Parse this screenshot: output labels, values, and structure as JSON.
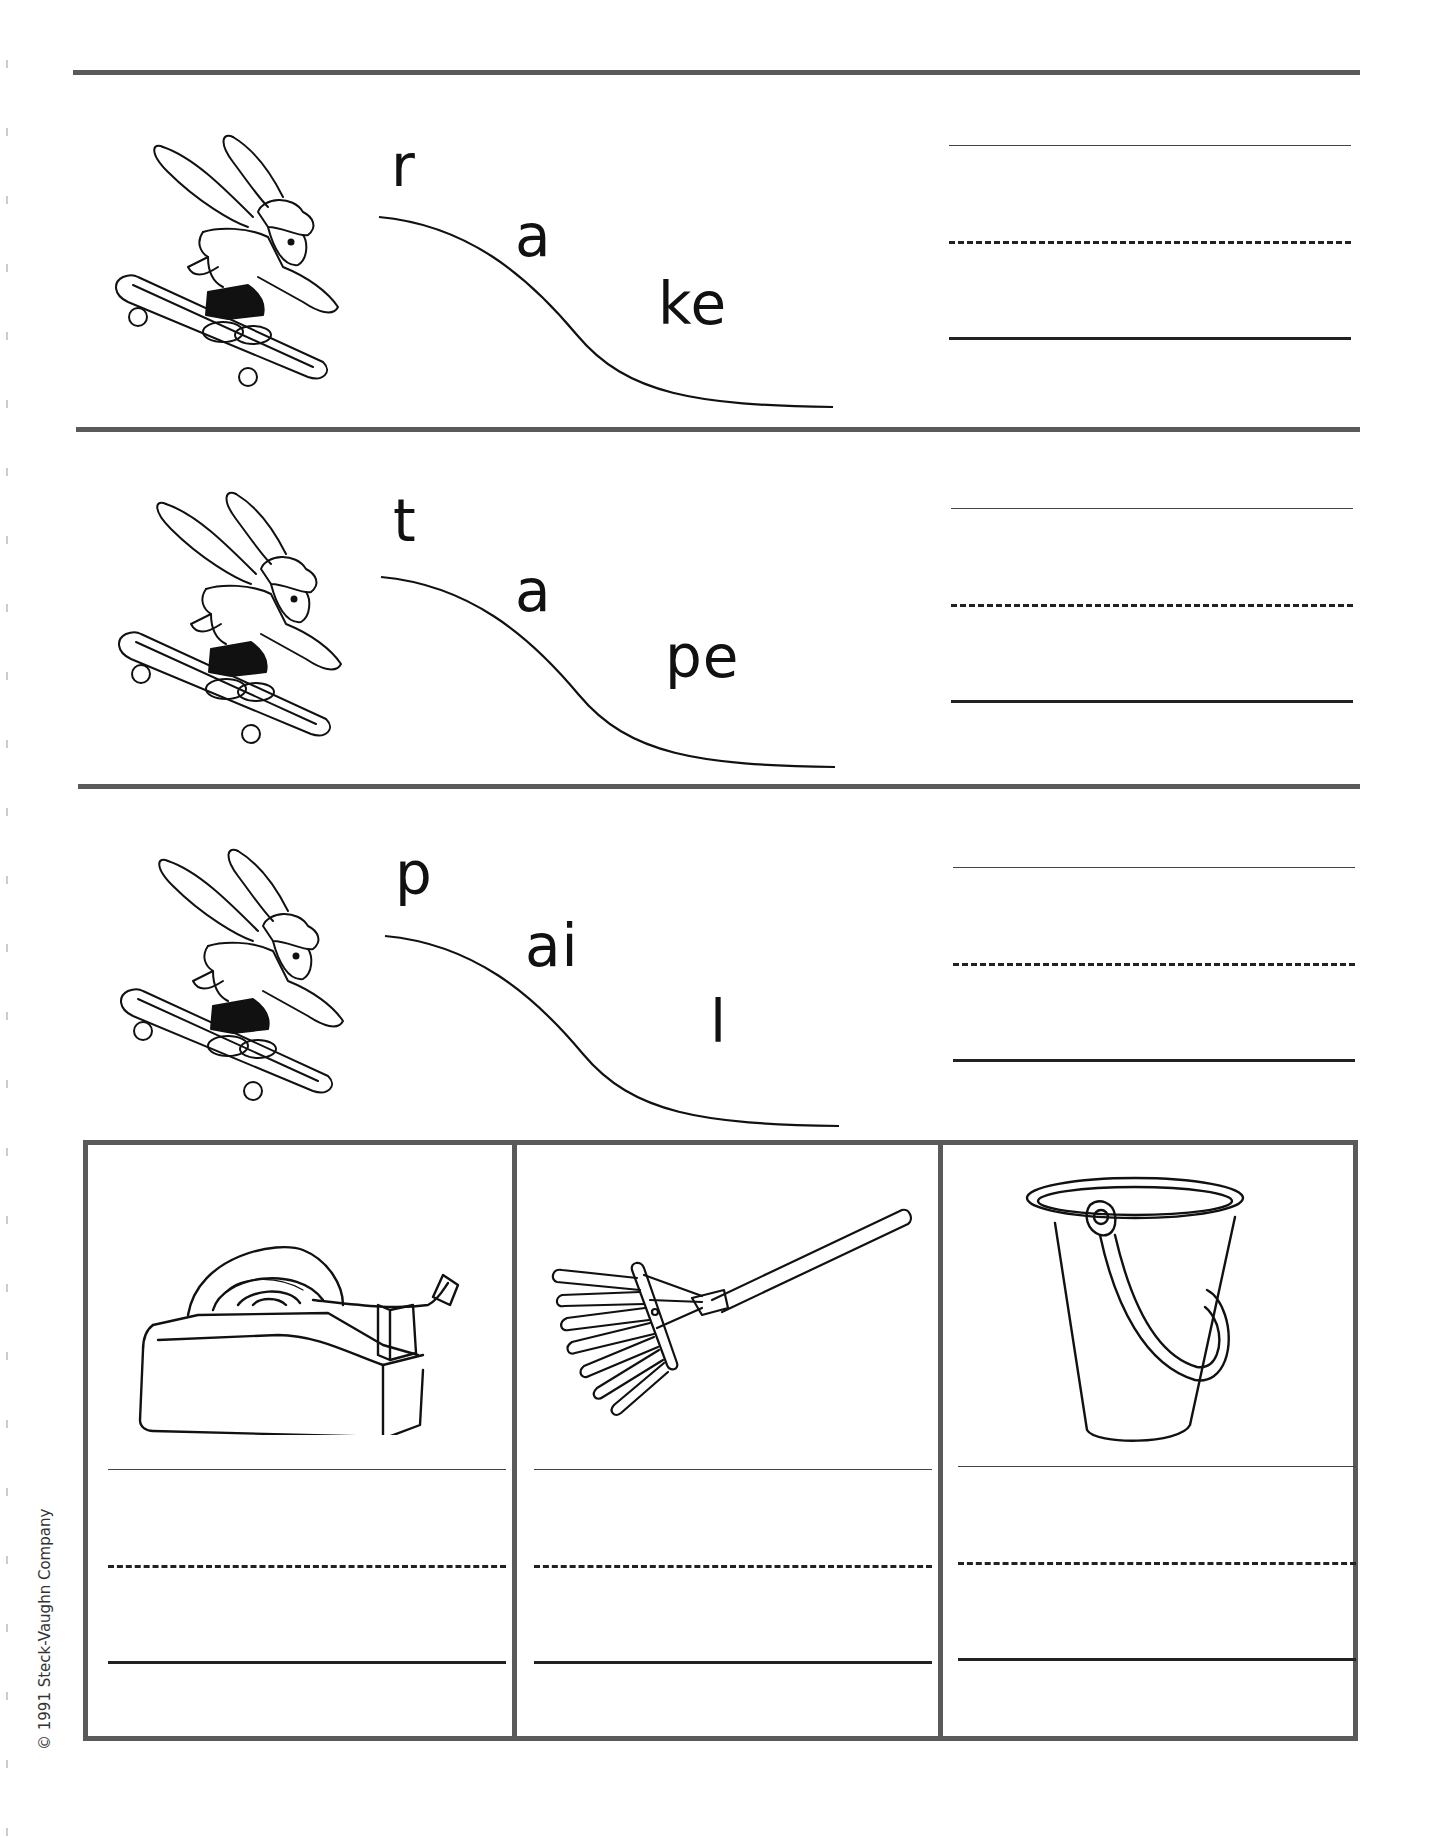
{
  "worksheet": {
    "rows": [
      {
        "word": "rake",
        "parts": [
          "r",
          "a",
          "ke"
        ],
        "image": "bunny-skateboard"
      },
      {
        "word": "tape",
        "parts": [
          "t",
          "a",
          "pe"
        ],
        "image": "bunny-skateboard"
      },
      {
        "word": "pail",
        "parts": [
          "p",
          "ai",
          "l"
        ],
        "image": "bunny-skateboard"
      }
    ],
    "picture_boxes": [
      {
        "image": "tape-dispenser"
      },
      {
        "image": "rake"
      },
      {
        "image": "pail"
      }
    ],
    "colors": {
      "rule": "#5a5a5a",
      "ink": "#111111"
    }
  },
  "footer": {
    "copyright": "© 1991 Steck-Vaughn Company"
  }
}
